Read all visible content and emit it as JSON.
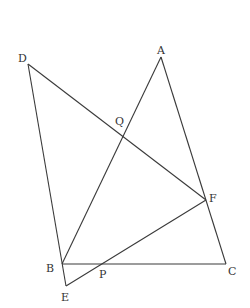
{
  "diagram": {
    "type": "geometry",
    "points": {
      "A": {
        "label": "A",
        "x": 161,
        "y": 57,
        "lx": 157,
        "ly": 54
      },
      "B": {
        "label": "B",
        "x": 62,
        "y": 264,
        "lx": 46,
        "ly": 272
      },
      "C": {
        "label": "C",
        "x": 226,
        "y": 264,
        "lx": 228,
        "ly": 275
      },
      "D": {
        "label": "D",
        "x": 28,
        "y": 64,
        "lx": 18,
        "ly": 62
      },
      "E": {
        "label": "E",
        "x": 66,
        "y": 286,
        "lx": 61,
        "ly": 301
      },
      "F": {
        "label": "F",
        "x": 206,
        "y": 200,
        "lx": 209,
        "ly": 202
      },
      "P": {
        "label": "P",
        "x": 102,
        "y": 264,
        "lx": 99,
        "ly": 278
      },
      "Q": {
        "label": "Q",
        "x": 123,
        "y": 134,
        "lx": 115,
        "ly": 125
      }
    },
    "segments": [
      {
        "from": "D",
        "to": "E"
      },
      {
        "from": "D",
        "to": "F"
      },
      {
        "from": "A",
        "to": "B"
      },
      {
        "from": "A",
        "to": "C"
      },
      {
        "from": "B",
        "to": "C"
      },
      {
        "from": "E",
        "to": "F"
      }
    ],
    "labels": {
      "A": "A",
      "B": "B",
      "C": "C",
      "D": "D",
      "E": "E",
      "F": "F",
      "P": "P",
      "Q": "Q"
    },
    "stroke_color": "#3a3a3a",
    "label_color": "#333333"
  }
}
